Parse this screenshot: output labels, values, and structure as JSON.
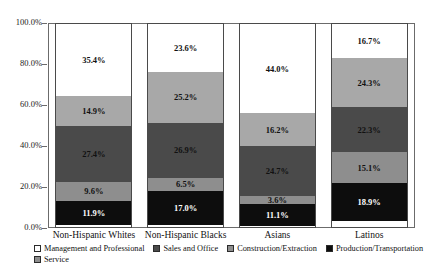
{
  "chart_data": {
    "type": "bar",
    "subtype": "stacked-bar-100",
    "title": "",
    "xlabel": "",
    "ylabel": "",
    "ylim": [
      0,
      100
    ],
    "ytick_labels": [
      "0.0%",
      "20.0%",
      "40.0%",
      "60.0%",
      "80.0%",
      "100.0%"
    ],
    "ytick_values": [
      0,
      20,
      40,
      60,
      80,
      100
    ],
    "grid": false,
    "legend_position": "bottom",
    "categories": [
      "Non-Hispanic Whites",
      "Non-Hispanic Blacks",
      "Asians",
      "Latinos"
    ],
    "series": [
      {
        "name": "Production/Transportation",
        "color": "#0d0d0d",
        "text_color": "#ffffff",
        "values": [
          11.9,
          17.0,
          11.1,
          18.9
        ],
        "labels": [
          "11.9%",
          "17.0%",
          "11.1%",
          "18.9%"
        ]
      },
      {
        "name": "Construction/Extraction",
        "color": "#8e8e8e",
        "text_color": "#111111",
        "values": [
          9.6,
          6.5,
          3.6,
          15.1
        ],
        "labels": [
          "9.6%",
          "6.5%",
          "3.6%",
          "15.1%"
        ]
      },
      {
        "name": "Service",
        "color": "#4a4a4a",
        "text_color": "#111111",
        "values": [
          27.4,
          26.9,
          24.7,
          22.3
        ],
        "labels": [
          "27.4%",
          "26.9%",
          "24.7%",
          "22.3%"
        ]
      },
      {
        "name": "Sales and Office",
        "color": "#a8a8a8",
        "text_color": "#111111",
        "values": [
          14.9,
          25.2,
          16.2,
          24.3
        ],
        "labels": [
          "14.9%",
          "25.2%",
          "16.2%",
          "24.3%"
        ]
      },
      {
        "name": "Management and Professional",
        "color": "#ffffff",
        "text_color": "#111111",
        "values": [
          35.4,
          23.6,
          44.0,
          16.7
        ],
        "labels": [
          "35.4%",
          "23.6%",
          "44.0%",
          "16.7%"
        ]
      }
    ]
  },
  "legend": {
    "row1": [
      {
        "label": "Management and Professional",
        "color": "#ffffff"
      },
      {
        "label": "Sales and Office",
        "color": "#4a4a4a"
      },
      {
        "label": "Construction/Extraction",
        "color": "#8e8e8e"
      },
      {
        "label": "Production/Transportation",
        "color": "#0d0d0d"
      }
    ],
    "row2": [
      {
        "label": "Service",
        "color": "#8e8e8e"
      }
    ]
  }
}
